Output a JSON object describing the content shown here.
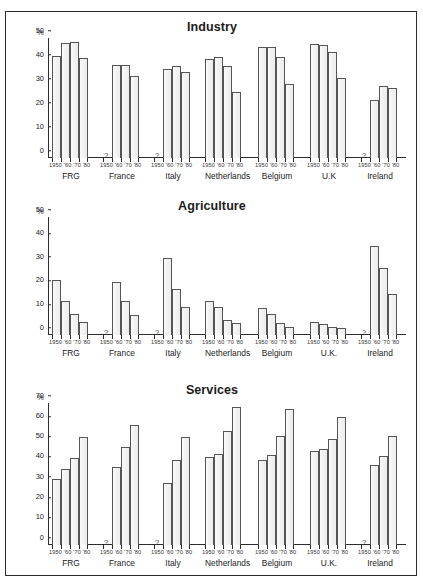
{
  "page": {
    "top_strip_left": "",
    "top_strip_right": ""
  },
  "panels": [
    {
      "title": "Industry"
    },
    {
      "title": "Agriculture"
    },
    {
      "title": "Services"
    }
  ],
  "axis": {
    "unit": "%",
    "missing_marker": "?",
    "period_labels": "1950 '60 '70 '80",
    "periods": [
      "1950",
      "'60",
      "'70",
      "'80"
    ]
  },
  "chart_data": [
    {
      "type": "bar",
      "title": "Industry",
      "xlabel": "",
      "ylabel": "%",
      "ylim": [
        0,
        50
      ],
      "yticks": [
        0,
        10,
        20,
        30,
        40,
        50
      ],
      "grid": false,
      "legend": "none",
      "categories": [
        "1950",
        "'60",
        "'70",
        "'80"
      ],
      "groups": [
        {
          "name": "FRG",
          "values": [
            42.5,
            48.0,
            48.5,
            41.5
          ]
        },
        {
          "name": "France",
          "values": [
            null,
            38.8,
            38.8,
            34.0
          ]
        },
        {
          "name": "Italy",
          "values": [
            null,
            37.0,
            38.5,
            36.0
          ]
        },
        {
          "name": "Netherlands",
          "values": [
            41.2,
            42.2,
            38.4,
            27.3
          ]
        },
        {
          "name": "Belgium",
          "values": [
            46.2,
            46.2,
            42.0,
            30.8
          ]
        },
        {
          "name": "U.K",
          "values": [
            47.5,
            47.0,
            44.0,
            33.3
          ]
        },
        {
          "name": "Ireland",
          "values": [
            null,
            24.0,
            30.2,
            29.3
          ]
        }
      ]
    },
    {
      "type": "bar",
      "title": "Agriculture",
      "xlabel": "",
      "ylabel": "%",
      "ylim": [
        0,
        50
      ],
      "yticks": [
        0,
        10,
        20,
        30,
        40,
        50
      ],
      "grid": false,
      "legend": "none",
      "categories": [
        "1950",
        "'60",
        "'70",
        "'80"
      ],
      "groups": [
        {
          "name": "FRG",
          "values": [
            23.5,
            14.3,
            8.8,
            5.6
          ]
        },
        {
          "name": "France",
          "values": [
            null,
            22.5,
            14.3,
            8.3
          ]
        },
        {
          "name": "Italy",
          "values": [
            null,
            32.8,
            19.4,
            11.7
          ]
        },
        {
          "name": "Netherlands",
          "values": [
            14.4,
            12.0,
            6.2,
            5.1
          ]
        },
        {
          "name": "Belgium",
          "values": [
            11.5,
            8.7,
            5.3,
            3.2
          ]
        },
        {
          "name": "U.K.",
          "values": [
            5.7,
            4.8,
            3.4,
            2.9
          ]
        },
        {
          "name": "Ireland",
          "values": [
            null,
            37.7,
            28.4,
            17.5
          ]
        }
      ]
    },
    {
      "type": "bar",
      "title": "Services",
      "xlabel": "",
      "ylabel": "%",
      "ylim": [
        0,
        70
      ],
      "yticks": [
        0,
        10,
        20,
        30,
        40,
        50,
        60,
        70
      ],
      "grid": false,
      "legend": "none",
      "categories": [
        "1950",
        "'60",
        "'70",
        "'80"
      ],
      "groups": [
        {
          "name": "FRG",
          "values": [
            32.7,
            37.7,
            43.0,
            53.2
          ]
        },
        {
          "name": "France",
          "values": [
            null,
            38.4,
            48.2,
            59.0
          ]
        },
        {
          "name": "Italy",
          "values": [
            null,
            30.7,
            42.0,
            53.2
          ]
        },
        {
          "name": "Netherlands",
          "values": [
            43.4,
            45.0,
            56.4,
            68.0
          ]
        },
        {
          "name": "Belgium",
          "values": [
            42.0,
            44.2,
            53.9,
            67.2
          ]
        },
        {
          "name": "U.K.",
          "values": [
            46.2,
            47.4,
            52.4,
            63.1
          ]
        },
        {
          "name": "Ireland",
          "values": [
            null,
            39.4,
            44.1,
            53.9
          ]
        }
      ]
    }
  ]
}
